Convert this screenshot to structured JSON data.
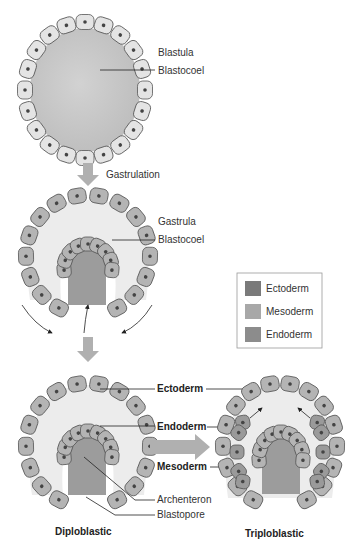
{
  "header_text": "",
  "blastula": {
    "title": "Blastula",
    "cavity_label": "Blastocoel"
  },
  "step1": {
    "label": "Gastrulation"
  },
  "gastrula": {
    "title": "Gastrula",
    "cavity_label": "Blastocoel"
  },
  "legend": {
    "items": [
      {
        "label": "Ectoderm",
        "color": "#7a7a7a"
      },
      {
        "label": "Mesoderm",
        "color": "#a8a8a8"
      },
      {
        "label": "Endoderm",
        "color": "#8c8c8c"
      }
    ]
  },
  "diploblastic": {
    "caption": "Diploblastic",
    "labels": {
      "ectoderm": "Ectoderm",
      "endoderm": "Endoderm",
      "mesoderm": "Mesoderm",
      "archenteron": "Archenteron",
      "blastopore": "Blastopore"
    }
  },
  "triploblastic": {
    "caption": "Triploblastic"
  },
  "colors": {
    "blastula_cell": "#e4e4e4",
    "ecto_cell": "#b4b4b4",
    "meso_cell": "#9a9a9a",
    "cavity_light": "#ececec",
    "archenteron": "#9c9c9c",
    "arrow": "#b0b0b0",
    "nucleus": "#444444"
  }
}
